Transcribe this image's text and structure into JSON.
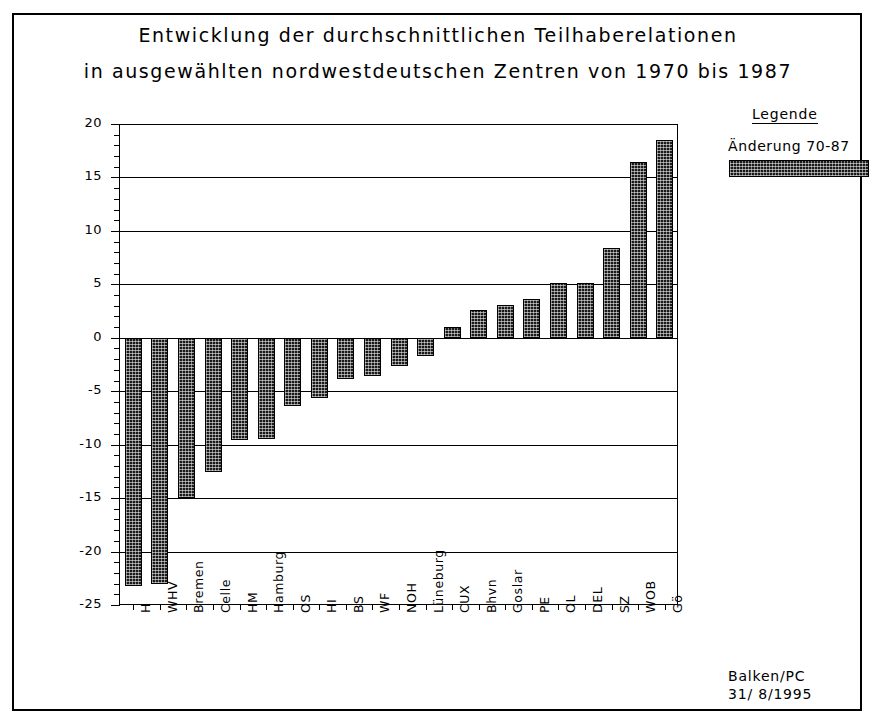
{
  "title_line1": "Entwicklung der durchschnittlichen Teilhaberelationen",
  "title_line2": "in ausgewählten nordwestdeutschen Zentren von 1970 bis 1987",
  "legend": {
    "heading": "Legende",
    "entries": [
      {
        "label": "Änderung 70-87",
        "color": "#1a1a1a",
        "pattern": "cross-hatch"
      }
    ]
  },
  "footer": {
    "source": "Balken/PC",
    "date": "31/ 8/1995"
  },
  "chart_data": {
    "type": "bar",
    "title": "Entwicklung der durchschnittlichen Teilhaberelationen in ausgewählten nordwestdeutschen Zentren von 1970 bis 1987",
    "xlabel": "",
    "ylabel": "Veränderung in Prozent",
    "ylim": [
      -25,
      20
    ],
    "ytick_step": 5,
    "yticks": [
      20,
      15,
      10,
      5,
      0,
      -5,
      -10,
      -15,
      -20,
      -25
    ],
    "ytick_labels": [
      "20",
      "15",
      "10",
      "5",
      "0",
      "-5",
      "-10",
      "-15",
      "-20",
      "-25"
    ],
    "minor_ticks_per_interval": 5,
    "grid": "horizontal",
    "legend_position": "top-right-outside",
    "categories": [
      "H",
      "WHV",
      "Bremen",
      "Celle",
      "HM",
      "Hamburg",
      "OS",
      "HI",
      "BS",
      "WF",
      "NOH",
      "Lüneburg",
      "CUX",
      "Bhvn",
      "Goslar",
      "PE",
      "OL",
      "DEL",
      "SZ",
      "WOB",
      "Gö"
    ],
    "series": [
      {
        "name": "Änderung 70-87",
        "values": [
          -23.2,
          -23.0,
          -15.0,
          -12.6,
          -9.6,
          -9.5,
          -6.4,
          -5.6,
          -3.9,
          -3.6,
          -2.6,
          -1.7,
          1.0,
          2.6,
          3.1,
          3.6,
          5.1,
          5.1,
          8.4,
          16.4,
          18.5
        ]
      }
    ]
  }
}
